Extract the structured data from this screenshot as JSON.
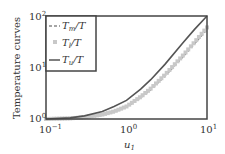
{
  "chart_data": {
    "type": "line",
    "title": "",
    "xlabel": "u1",
    "ylabel": "Temperature curves",
    "xscale": "log",
    "yscale": "log",
    "xlim": [
      0.1,
      10
    ],
    "ylim": [
      1,
      100
    ],
    "xticks": [
      "10^-1",
      "10^0",
      "10^1"
    ],
    "yticks": [
      "10^0",
      "10^1",
      "10^2"
    ],
    "grid": false,
    "legend_position": "upper left",
    "x": [
      0.1,
      0.2,
      0.3,
      0.5,
      0.7,
      1.0,
      1.5,
      2.0,
      3.0,
      5.0,
      7.0,
      10.0
    ],
    "series": [
      {
        "name": "Tm/T",
        "style": "dashed",
        "color": "#888888",
        "values": [
          1.0,
          1.03,
          1.08,
          1.2,
          1.38,
          1.7,
          2.6,
          3.7,
          6.8,
          16,
          29,
          55
        ]
      },
      {
        "name": "Tl/T",
        "style": "markers",
        "color": "#c8c8c8",
        "values": [
          1.0,
          1.03,
          1.08,
          1.22,
          1.4,
          1.75,
          2.7,
          3.9,
          7.2,
          17,
          31,
          60
        ]
      },
      {
        "name": "Tu/T",
        "style": "solid",
        "color": "#555555",
        "values": [
          1.0,
          1.05,
          1.15,
          1.4,
          1.75,
          2.3,
          3.8,
          5.8,
          11.5,
          30,
          55,
          100
        ]
      }
    ]
  },
  "labels": {
    "ylabel": "Temperature curves",
    "xlabel_main": "u",
    "xlabel_sub": "1",
    "xtick_base": "10",
    "xtick_exps": [
      "−1",
      "0",
      "1"
    ],
    "ytick_exps": [
      "0",
      "1",
      "2"
    ],
    "legend": [
      {
        "main": "T",
        "sub": "m",
        "rest": "/T"
      },
      {
        "main": "T",
        "sub": "l",
        "rest": "/T"
      },
      {
        "main": "T",
        "sub": "u",
        "rest": "/T"
      }
    ]
  }
}
